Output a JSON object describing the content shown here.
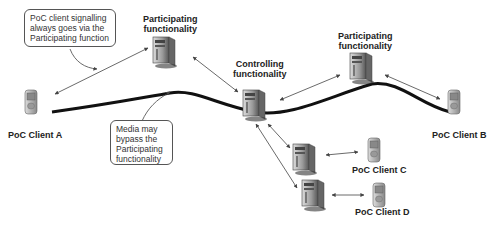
{
  "diagram": {
    "callouts": {
      "signalling": "PoC client signalling always goes via the Participating function",
      "media": "Media may bypass the Participating functionality"
    },
    "nodes": {
      "participating_left": {
        "line1": "Participating",
        "line2": "functionality"
      },
      "controlling": {
        "line1": "Controlling",
        "line2": "functionality"
      },
      "participating_right": {
        "line1": "Participating",
        "line2": "functionality"
      },
      "client_a": "PoC Client A",
      "client_b": "PoC Client B",
      "client_c": "PoC Client C",
      "client_d": "PoC Client D"
    },
    "colors": {
      "line": "#111111",
      "arrow": "#444444",
      "server": "#9a9a9a",
      "phone": "#b0b0b0"
    }
  }
}
